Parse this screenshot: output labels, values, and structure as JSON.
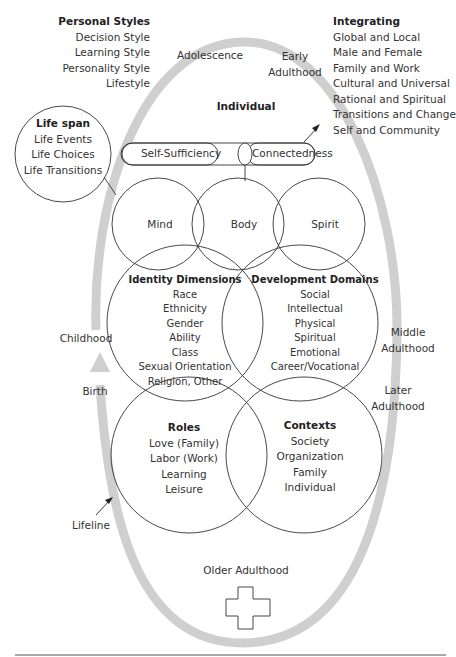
{
  "personal_styles": {
    "title": "Personal Styles",
    "items": [
      "Decision Style",
      "Learning Style",
      "Personality Style",
      "Lifestyle"
    ]
  },
  "integrating": {
    "title": "Integrating",
    "items": [
      "Global and Local",
      "Male and Female",
      "Family and Work",
      "Cultural and Universal",
      "Rational and Spiritual",
      "Transitions and Change",
      "Self and Community"
    ]
  },
  "life_span": {
    "title": "Life span",
    "items": [
      "Life Events",
      "Life Choices",
      "Life Transitions"
    ]
  },
  "individual": {
    "title": "Individual",
    "self_sufficiency": "Self-Sufficiency",
    "connectedness": "Connectedness"
  },
  "trio": {
    "mind": "Mind",
    "body": "Body",
    "spirit": "Spirit"
  },
  "identity_dimensions": {
    "title": "Identity Dimensions",
    "items": [
      "Race",
      "Ethnicity",
      "Gender",
      "Ability",
      "Class",
      "Sexual Orientation",
      "Religion, Other"
    ]
  },
  "development_domains": {
    "title": "Development Domains",
    "items": [
      "Social",
      "Intellectual",
      "Physical",
      "Spiritual",
      "Emotional",
      "Career/Vocational"
    ]
  },
  "roles": {
    "title": "Roles",
    "items": [
      "Love (Family)",
      "Labor (Work)",
      "Learning",
      "Leisure"
    ]
  },
  "contexts": {
    "title": "Contexts",
    "items": [
      "Society",
      "Organization",
      "Family",
      "Individual"
    ]
  },
  "lifeline": {
    "label": "Lifeline",
    "stages": {
      "birth": "Birth",
      "childhood": "Childhood",
      "adolescence": "Adolescence",
      "early_adulthood_1": "Early",
      "early_adulthood_2": "Adulthood",
      "middle_adulthood_1": "Middle",
      "middle_adulthood_2": "Adulthood",
      "later_adulthood_1": "Later",
      "later_adulthood_2": "Adulthood",
      "older_adulthood": "Older Adulthood"
    }
  },
  "colors": {
    "lifeline": "#cfcfcf",
    "lines": "#333333",
    "text": "#333333"
  }
}
